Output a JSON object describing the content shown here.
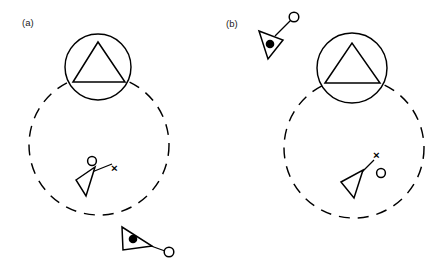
{
  "figure": {
    "width": 438,
    "height": 264,
    "background_color": "#ffffff",
    "stroke_color": "#000000",
    "caption_style": "two-panel scientific diagram"
  },
  "panels": [
    {
      "id": "a",
      "label": "(a)",
      "label_x": 22,
      "label_y": 26,
      "dashed_circle": {
        "name": "range-boundary-circle",
        "cx": 99,
        "cy": 145,
        "r": 70,
        "style": "dashed"
      },
      "solid_circle": {
        "name": "target-zone-circle",
        "cx": 98,
        "cy": 67,
        "r": 33,
        "style": "solid"
      },
      "inner_triangle": {
        "name": "triangle-in-circle",
        "points": "73,82 98,42 125,82"
      },
      "cross_mark": {
        "name": "cross-marker",
        "x": 115,
        "y": 168,
        "glyph": "×"
      },
      "open_circle_marker": {
        "name": "open-circle-marker",
        "cx": 92,
        "cy": 161,
        "r": 4.4
      },
      "wedge": {
        "name": "wedge-pointer",
        "points": "76,180 95,167 86,196",
        "pointer_line": {
          "x1": 92,
          "y1": 172,
          "x2": 112,
          "y2": 164
        }
      },
      "tethered_unit": {
        "name": "tethered-unit",
        "triangle_points": "122,227 152,246 123,250",
        "dot": {
          "cx": 133,
          "cy": 239,
          "r": 4.3
        },
        "tether_line": {
          "x1": 151,
          "y1": 246,
          "x2": 165,
          "y2": 251
        },
        "tether_circle": {
          "cx": 169,
          "cy": 252,
          "r": 4.8
        }
      }
    },
    {
      "id": "b",
      "label": "(b)",
      "label_x": 226,
      "label_y": 27,
      "dashed_circle": {
        "name": "range-boundary-circle",
        "cx": 354,
        "cy": 148,
        "r": 70,
        "style": "dashed"
      },
      "solid_circle": {
        "name": "target-zone-circle",
        "cx": 352,
        "cy": 68,
        "r": 35,
        "style": "solid"
      },
      "inner_triangle": {
        "name": "triangle-in-circle",
        "points": "325,83 352,43 380,83"
      },
      "cross_mark": {
        "name": "cross-marker",
        "x": 377,
        "y": 155,
        "glyph": "×"
      },
      "open_circle_marker": {
        "name": "open-circle-marker",
        "cx": 381,
        "cy": 173,
        "r": 4.4
      },
      "wedge": {
        "name": "wedge-pointer",
        "points": "341,182 363,170 354,198",
        "pointer_line": {
          "x1": 359,
          "y1": 175,
          "x2": 374,
          "y2": 160
        }
      },
      "tethered_unit": {
        "name": "tethered-unit",
        "triangle_points": "259,31 283,40 268,59",
        "dot": {
          "cx": 270,
          "cy": 44,
          "r": 4.3
        },
        "tether_line": {
          "x1": 275,
          "y1": 36,
          "x2": 291,
          "y2": 20
        },
        "tether_circle": {
          "cx": 294,
          "cy": 17,
          "r": 4.8
        }
      }
    }
  ]
}
